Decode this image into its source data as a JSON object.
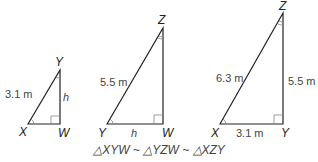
{
  "triangles": [
    {
      "name": "XYW",
      "vertices": {
        "a": "X",
        "b": "Y",
        "c": "W"
      },
      "labels": {
        "hyp": "3.1 m",
        "leg": "h"
      }
    },
    {
      "name": "YZW",
      "vertices": {
        "a": "Y",
        "b": "Z",
        "c": "W"
      },
      "labels": {
        "hyp": "5.5 m",
        "base": "h"
      }
    },
    {
      "name": "XZY",
      "vertices": {
        "a": "X",
        "b": "Z",
        "c": "Y"
      },
      "labels": {
        "hyp": "6.3 m",
        "leg": "5.5 m",
        "base": "3.1 m"
      }
    }
  ],
  "caption": "△XYW ~ △YZW ~ △XZY"
}
